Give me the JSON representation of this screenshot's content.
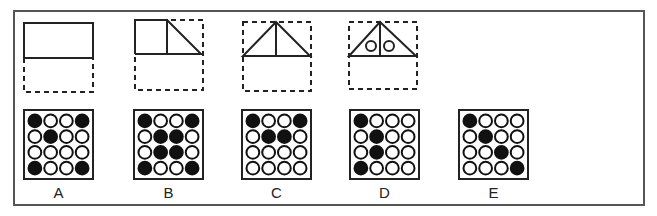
{
  "question": {
    "sequence_figures": [
      {
        "id": "fig1",
        "description": "rectangle top half solid, bottom half dashed"
      },
      {
        "id": "fig2",
        "description": "square plus right triangle in top half of dashed square"
      },
      {
        "id": "fig3",
        "description": "triangle with vertical center line in dashed square"
      },
      {
        "id": "fig4",
        "description": "triangle with vertical center line and two small circles in dashed square"
      }
    ]
  },
  "options": [
    {
      "label": "A",
      "grid": [
        [
          1,
          0,
          0,
          1
        ],
        [
          0,
          1,
          0,
          0
        ],
        [
          0,
          0,
          0,
          0
        ],
        [
          1,
          0,
          0,
          1
        ]
      ]
    },
    {
      "label": "B",
      "grid": [
        [
          1,
          0,
          0,
          1
        ],
        [
          0,
          1,
          1,
          0
        ],
        [
          0,
          1,
          1,
          0
        ],
        [
          1,
          0,
          0,
          1
        ]
      ]
    },
    {
      "label": "C",
      "grid": [
        [
          1,
          0,
          0,
          1
        ],
        [
          0,
          1,
          1,
          0
        ],
        [
          0,
          0,
          0,
          0
        ],
        [
          0,
          0,
          0,
          0
        ]
      ]
    },
    {
      "label": "D",
      "grid": [
        [
          1,
          0,
          0,
          0
        ],
        [
          0,
          1,
          0,
          0
        ],
        [
          0,
          1,
          0,
          0
        ],
        [
          1,
          0,
          0,
          0
        ]
      ]
    },
    {
      "label": "E",
      "grid": [
        [
          1,
          0,
          0,
          0
        ],
        [
          0,
          1,
          0,
          0
        ],
        [
          0,
          0,
          1,
          0
        ],
        [
          0,
          0,
          0,
          1
        ]
      ]
    }
  ],
  "colors": {
    "line": "#222222",
    "frame": "#555555",
    "fill": "#111111"
  }
}
